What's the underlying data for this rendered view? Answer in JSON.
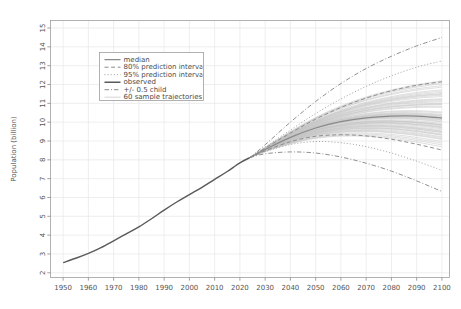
{
  "chart_data": {
    "type": "line",
    "title": "",
    "xlabel": "",
    "ylabel": "Population (billion)",
    "xlim": [
      1945,
      2103
    ],
    "ylim": [
      1.75,
      15.4
    ],
    "grid": true,
    "legend_position": "upper-left-inside",
    "xticks": [
      1950,
      1960,
      1970,
      1980,
      1990,
      2000,
      2010,
      2020,
      2030,
      2040,
      2050,
      2060,
      2070,
      2080,
      2090,
      2100
    ],
    "xtick_labels": [
      "1950",
      "1960",
      "1970",
      "1980",
      "1990",
      "2000",
      "2010",
      "2020",
      "2030",
      "2040",
      "2050",
      "2060",
      "2070",
      "2080",
      "2090",
      "2100"
    ],
    "yticks": [
      2,
      3,
      4,
      5,
      6,
      7,
      8,
      9,
      10,
      11,
      12,
      13,
      14,
      15
    ],
    "ytick_labels": [
      "2",
      "3",
      "4",
      "5",
      "6",
      "7",
      "8",
      "9",
      "10",
      "11",
      "12",
      "13",
      "14",
      "15"
    ],
    "legend_entries": [
      {
        "label": "median",
        "style": "solid",
        "color": "#8a8a8a",
        "width": 1.2
      },
      {
        "label": "80% prediction interva",
        "style": "dashed",
        "color": "#8a8a8a",
        "width": 1.0
      },
      {
        "label": "95% prediction interva",
        "style": "dotted",
        "color": "#9a9a9a",
        "width": 1.0
      },
      {
        "label": "observed",
        "style": "solid",
        "color": "#5a5a5a",
        "width": 1.4
      },
      {
        "label": "+/- 0.5 child",
        "style": "dashdot",
        "color": "#8a8a8a",
        "width": 1.0
      },
      {
        "label": "60 sample trajectories",
        "style": "solid",
        "color": "#c2c2c2",
        "width": 0.7
      }
    ],
    "x_observed": [
      1950,
      1955,
      1960,
      1965,
      1970,
      1975,
      1980,
      1985,
      1990,
      1995,
      2000,
      2005,
      2010,
      2015,
      2020,
      2024
    ],
    "series": [
      {
        "name": "observed",
        "style": "solid",
        "color": "#5a5a5a",
        "x": [
          1950,
          1955,
          1960,
          1965,
          1970,
          1975,
          1980,
          1985,
          1990,
          1995,
          2000,
          2005,
          2010,
          2015,
          2020,
          2024
        ],
        "values": [
          2.54,
          2.77,
          3.03,
          3.34,
          3.7,
          4.07,
          4.44,
          4.87,
          5.33,
          5.76,
          6.15,
          6.54,
          6.96,
          7.38,
          7.84,
          8.12
        ]
      },
      {
        "name": "median",
        "style": "solid",
        "color": "#8a8a8a",
        "x": [
          2024,
          2030,
          2040,
          2050,
          2060,
          2070,
          2080,
          2090,
          2100
        ],
        "values": [
          8.12,
          8.55,
          9.19,
          9.69,
          10.03,
          10.23,
          10.32,
          10.32,
          10.22
        ]
      },
      {
        "name": "80% prediction interval upper",
        "style": "dashed",
        "color": "#8a8a8a",
        "x": [
          2024,
          2030,
          2040,
          2050,
          2060,
          2070,
          2080,
          2090,
          2100
        ],
        "values": [
          8.12,
          8.62,
          9.42,
          10.16,
          10.78,
          11.28,
          11.67,
          11.96,
          12.15
        ]
      },
      {
        "name": "80% prediction interval lower",
        "style": "dashed",
        "color": "#8a8a8a",
        "x": [
          2024,
          2030,
          2040,
          2050,
          2060,
          2070,
          2080,
          2090,
          2100
        ],
        "values": [
          8.12,
          8.48,
          8.96,
          9.25,
          9.33,
          9.27,
          9.09,
          8.83,
          8.52
        ]
      },
      {
        "name": "95% prediction interval upper",
        "style": "dotted",
        "color": "#9a9a9a",
        "x": [
          2024,
          2030,
          2040,
          2050,
          2060,
          2070,
          2080,
          2090,
          2100
        ],
        "values": [
          8.12,
          8.68,
          9.58,
          10.46,
          11.23,
          11.9,
          12.46,
          12.92,
          13.25
        ]
      },
      {
        "name": "95% prediction interval lower",
        "style": "dotted",
        "color": "#9a9a9a",
        "x": [
          2024,
          2030,
          2040,
          2050,
          2060,
          2070,
          2080,
          2090,
          2100
        ],
        "values": [
          8.12,
          8.43,
          8.81,
          8.97,
          8.91,
          8.7,
          8.36,
          7.93,
          7.44
        ]
      },
      {
        "name": "+/- 0.5 child upper",
        "style": "dashdot",
        "color": "#8a8a8a",
        "x": [
          2024,
          2030,
          2040,
          2050,
          2060,
          2070,
          2080,
          2090,
          2100
        ],
        "values": [
          8.12,
          8.8,
          10.0,
          11.1,
          12.05,
          12.85,
          13.5,
          14.05,
          14.5
        ]
      },
      {
        "name": "+/- 0.5 child lower",
        "style": "dashdot",
        "color": "#8a8a8a",
        "x": [
          2024,
          2030,
          2040,
          2050,
          2060,
          2070,
          2080,
          2090,
          2100
        ],
        "values": [
          8.12,
          8.32,
          8.42,
          8.36,
          8.15,
          7.82,
          7.4,
          6.88,
          6.32
        ]
      }
    ],
    "sample_trajectories": {
      "name": "60 sample trajectories",
      "count": 60,
      "color": "#c2c2c2",
      "x": [
        2024,
        2030,
        2040,
        2050,
        2060,
        2070,
        2080,
        2090,
        2100
      ],
      "endpoint_range_2100": [
        8.6,
        12.1
      ],
      "values": [
        [
          8.12,
          8.5,
          9.08,
          9.52,
          9.79,
          9.93,
          9.94,
          9.86,
          9.7
        ],
        [
          8.12,
          8.6,
          9.35,
          9.99,
          10.48,
          10.85,
          11.1,
          11.27,
          11.36
        ],
        [
          8.12,
          8.52,
          9.12,
          9.58,
          9.86,
          10.02,
          10.05,
          9.98,
          9.84
        ],
        [
          8.12,
          8.57,
          9.28,
          9.85,
          10.27,
          10.56,
          10.74,
          10.83,
          10.85
        ],
        [
          8.12,
          8.49,
          9.02,
          9.42,
          9.65,
          9.75,
          9.73,
          9.62,
          9.44
        ],
        [
          8.12,
          8.62,
          9.41,
          10.1,
          10.64,
          11.06,
          11.36,
          11.58,
          11.72
        ],
        [
          8.12,
          8.54,
          9.18,
          9.7,
          10.03,
          10.23,
          10.3,
          10.27,
          10.16
        ],
        [
          8.12,
          8.47,
          8.96,
          9.32,
          9.51,
          9.57,
          9.52,
          9.38,
          9.18
        ],
        [
          8.12,
          8.58,
          9.31,
          9.9,
          10.34,
          10.65,
          10.85,
          10.96,
          11.0
        ],
        [
          8.12,
          8.55,
          9.22,
          9.76,
          10.12,
          10.34,
          10.44,
          10.43,
          10.34
        ],
        [
          8.12,
          8.51,
          9.06,
          9.48,
          9.73,
          9.85,
          9.85,
          9.75,
          9.59
        ],
        [
          8.12,
          8.64,
          9.47,
          10.2,
          10.79,
          11.25,
          11.6,
          11.86,
          12.05
        ],
        [
          8.12,
          8.53,
          9.15,
          9.65,
          9.96,
          10.14,
          10.19,
          10.14,
          10.01
        ],
        [
          8.12,
          8.46,
          8.91,
          9.24,
          9.4,
          9.43,
          9.35,
          9.19,
          8.97
        ],
        [
          8.12,
          8.59,
          9.34,
          9.96,
          10.42,
          10.76,
          10.99,
          11.13,
          11.2
        ],
        [
          8.12,
          8.56,
          9.25,
          9.81,
          10.19,
          10.43,
          10.55,
          10.56,
          10.49
        ],
        [
          8.12,
          8.5,
          9.04,
          9.45,
          9.69,
          9.8,
          9.79,
          9.68,
          9.51
        ],
        [
          8.12,
          8.61,
          9.38,
          10.05,
          10.56,
          10.95,
          11.22,
          11.41,
          11.52
        ],
        [
          8.12,
          8.54,
          9.19,
          9.72,
          10.06,
          10.27,
          10.35,
          10.33,
          10.23
        ],
        [
          8.12,
          8.48,
          8.99,
          9.37,
          9.58,
          9.66,
          9.63,
          9.5,
          9.31
        ],
        [
          8.12,
          8.63,
          9.44,
          10.15,
          10.71,
          11.15,
          11.47,
          11.7,
          11.86
        ],
        [
          8.12,
          8.52,
          9.1,
          9.55,
          9.82,
          9.96,
          9.98,
          9.9,
          9.75
        ],
        [
          8.12,
          8.57,
          9.29,
          9.88,
          10.31,
          10.61,
          10.8,
          10.9,
          10.93
        ],
        [
          8.12,
          8.55,
          9.21,
          9.74,
          10.09,
          10.3,
          10.39,
          10.37,
          10.27
        ],
        [
          8.12,
          8.45,
          8.87,
          9.17,
          9.3,
          9.31,
          9.21,
          9.03,
          8.79
        ],
        [
          8.12,
          8.6,
          9.36,
          10.01,
          10.51,
          10.89,
          11.15,
          11.33,
          11.43
        ],
        [
          8.12,
          8.53,
          9.14,
          9.62,
          9.92,
          10.09,
          10.13,
          10.07,
          9.93
        ],
        [
          8.12,
          8.49,
          9.01,
          9.4,
          9.62,
          9.71,
          9.68,
          9.56,
          9.37
        ],
        [
          8.12,
          8.58,
          9.32,
          9.93,
          10.38,
          10.7,
          10.91,
          11.03,
          11.08
        ],
        [
          8.12,
          8.56,
          9.24,
          9.79,
          10.16,
          10.39,
          10.5,
          10.5,
          10.42
        ],
        [
          8.12,
          8.51,
          9.07,
          9.5,
          9.76,
          9.89,
          9.9,
          9.81,
          9.65
        ],
        [
          8.12,
          8.65,
          9.5,
          10.25,
          10.86,
          11.34,
          11.71,
          11.99,
          12.19
        ],
        [
          8.12,
          8.54,
          9.17,
          9.68,
          10.0,
          10.19,
          10.25,
          10.21,
          10.1
        ],
        [
          8.12,
          8.47,
          8.94,
          9.29,
          9.46,
          9.51,
          9.44,
          9.29,
          9.08
        ],
        [
          8.12,
          8.59,
          9.33,
          9.94,
          10.4,
          10.73,
          10.95,
          11.08,
          11.14
        ],
        [
          8.12,
          8.55,
          9.23,
          9.77,
          10.14,
          10.36,
          10.46,
          10.46,
          10.37
        ],
        [
          8.12,
          8.5,
          9.03,
          9.43,
          9.67,
          9.77,
          9.76,
          9.64,
          9.47
        ],
        [
          8.12,
          8.62,
          9.4,
          10.08,
          10.61,
          11.02,
          11.31,
          11.52,
          11.65
        ],
        [
          8.12,
          8.53,
          9.16,
          9.67,
          9.98,
          10.16,
          10.22,
          10.17,
          10.05
        ],
        [
          8.12,
          8.48,
          8.98,
          9.34,
          9.54,
          9.61,
          9.57,
          9.43,
          9.23
        ],
        [
          8.12,
          8.61,
          9.39,
          10.06,
          10.58,
          10.98,
          11.26,
          11.46,
          11.58
        ],
        [
          8.12,
          8.52,
          9.11,
          9.57,
          9.84,
          9.99,
          10.02,
          9.95,
          9.8
        ],
        [
          8.12,
          8.57,
          9.27,
          9.84,
          10.25,
          10.53,
          10.7,
          10.78,
          10.79
        ],
        [
          8.12,
          8.55,
          9.2,
          9.73,
          10.07,
          10.28,
          10.36,
          10.34,
          10.24
        ],
        [
          8.12,
          8.46,
          8.89,
          9.2,
          9.35,
          9.37,
          9.28,
          9.11,
          8.88
        ],
        [
          8.12,
          8.6,
          9.37,
          10.03,
          10.54,
          10.92,
          11.19,
          11.38,
          11.48
        ],
        [
          8.12,
          8.53,
          9.13,
          9.6,
          9.89,
          10.05,
          10.08,
          10.01,
          9.87
        ],
        [
          8.12,
          8.49,
          9.0,
          9.38,
          9.6,
          9.68,
          9.65,
          9.52,
          9.33
        ],
        [
          8.12,
          8.58,
          9.3,
          9.89,
          10.32,
          10.63,
          10.82,
          10.92,
          10.96
        ],
        [
          8.12,
          8.56,
          9.26,
          9.82,
          10.21,
          10.46,
          10.59,
          10.61,
          10.54
        ],
        [
          8.12,
          8.51,
          9.05,
          9.46,
          9.71,
          9.82,
          9.81,
          9.7,
          9.53
        ],
        [
          8.12,
          8.64,
          9.48,
          10.22,
          10.82,
          11.29,
          11.65,
          11.92,
          12.11
        ],
        [
          8.12,
          8.54,
          9.18,
          9.69,
          10.02,
          10.21,
          10.27,
          10.24,
          10.13
        ],
        [
          8.12,
          8.47,
          8.95,
          9.3,
          9.48,
          9.54,
          9.47,
          9.33,
          9.12
        ],
        [
          8.12,
          8.59,
          9.35,
          9.98,
          10.45,
          10.79,
          11.02,
          11.17,
          11.24
        ],
        [
          8.12,
          8.55,
          9.22,
          9.75,
          10.1,
          10.32,
          10.41,
          10.4,
          10.31
        ],
        [
          8.12,
          8.5,
          9.09,
          9.53,
          9.8,
          9.94,
          9.96,
          9.88,
          9.73
        ],
        [
          8.12,
          8.63,
          9.45,
          10.17,
          10.74,
          11.19,
          11.52,
          11.77,
          11.94
        ],
        [
          8.12,
          8.52,
          9.12,
          9.59,
          9.87,
          10.03,
          10.06,
          10.0,
          9.86
        ],
        [
          8.12,
          8.45,
          8.85,
          9.14,
          9.26,
          9.25,
          9.14,
          8.94,
          8.69
        ]
      ]
    }
  }
}
